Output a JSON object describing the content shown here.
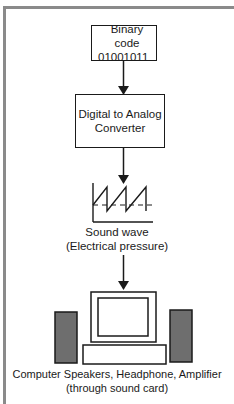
{
  "diagram": {
    "nodes": [
      {
        "id": "binary",
        "lines": [
          "Binary code",
          "01001011"
        ]
      },
      {
        "id": "dac",
        "lines": [
          "Digital to Analog",
          "Converter"
        ]
      },
      {
        "id": "wave",
        "lines": [
          "Sound wave",
          "(Electrical pressure)"
        ],
        "icon": "sawtooth-wave-icon"
      },
      {
        "id": "output",
        "lines": [
          "Computer Speakers, Headphone, Amplifier",
          "(through sound card)"
        ],
        "icon": "computer-with-speakers-icon"
      }
    ],
    "edges": [
      {
        "from": "binary",
        "to": "dac"
      },
      {
        "from": "dac",
        "to": "wave"
      },
      {
        "from": "wave",
        "to": "output"
      }
    ],
    "colors": {
      "frame": "#8a8a8a",
      "stroke": "#1a1a1a",
      "speaker_fill": "#6e6e6e"
    }
  }
}
